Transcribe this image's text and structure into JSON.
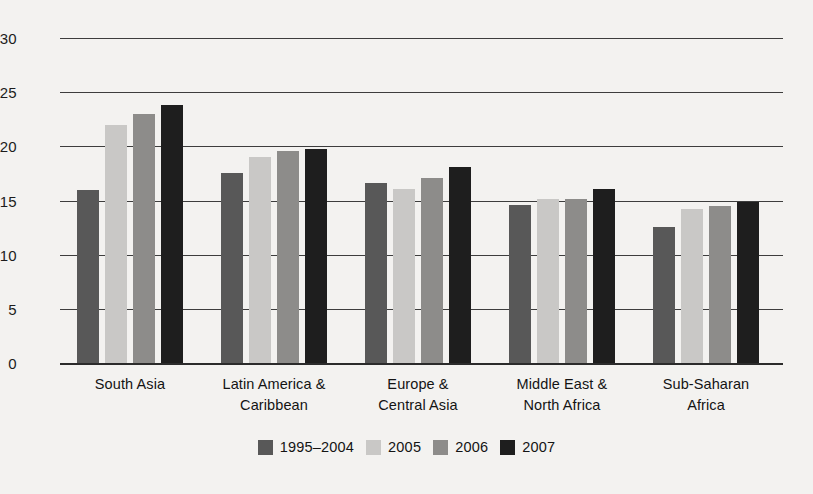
{
  "chart_data": {
    "type": "bar",
    "title": "",
    "subtitle": "",
    "xlabel": "",
    "ylabel": "",
    "ylim": [
      0,
      30
    ],
    "yticks": [
      0,
      5,
      10,
      15,
      20,
      25,
      30
    ],
    "ytick_labels": [
      "0",
      "5",
      "10",
      "15",
      "20",
      "25",
      "30"
    ],
    "grid": true,
    "legend_position": "bottom",
    "categories": [
      "South Asia",
      "Latin America & Caribbean",
      "Europe & Central Asia",
      "Middle East & North Africa",
      "Sub-Saharan Africa"
    ],
    "category_lines": [
      [
        "South Asia"
      ],
      [
        "Latin America &",
        "Caribbean"
      ],
      [
        "Europe &",
        "Central Asia"
      ],
      [
        "Middle East &",
        "North Africa"
      ],
      [
        "Sub-Saharan",
        "Africa"
      ]
    ],
    "series": [
      {
        "name": "1995–2004",
        "color": "#585858",
        "values": [
          16.0,
          17.5,
          16.6,
          14.6,
          12.6
        ]
      },
      {
        "name": "2005",
        "color": "#c9c8c6",
        "values": [
          22.0,
          19.0,
          16.1,
          15.1,
          14.2
        ]
      },
      {
        "name": "2006",
        "color": "#8d8c8a",
        "values": [
          23.0,
          19.6,
          17.1,
          15.1,
          14.5
        ]
      },
      {
        "name": "2007",
        "color": "#1e1e1e",
        "values": [
          23.8,
          19.8,
          18.1,
          16.1,
          14.9
        ]
      }
    ]
  },
  "legend": {
    "items": [
      {
        "label": "1995–2004",
        "color": "#585858"
      },
      {
        "label": "2005",
        "color": "#c9c8c6"
      },
      {
        "label": "2006",
        "color": "#8d8c8a"
      },
      {
        "label": "2007",
        "color": "#1e1e1e"
      }
    ]
  }
}
